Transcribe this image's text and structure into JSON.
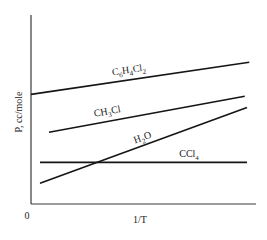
{
  "chart_data": {
    "type": "line",
    "title": "",
    "xlabel": "1/T",
    "ylabel": "P, cc/mole",
    "x_origin_label": "0",
    "xlim": [
      0,
      1
    ],
    "ylim": [
      0,
      1
    ],
    "grid": false,
    "legend": "inline labels",
    "note": "Schematic plot without numeric ticks; values are normalized to the axis extents (0 = origin, 1 = end of axis).",
    "series": [
      {
        "name": "C6H4Cl2",
        "label_parts": [
          [
            "C",
            ""
          ],
          [
            "6",
            "sub"
          ],
          [
            "H",
            ""
          ],
          [
            "4",
            "sub"
          ],
          [
            "Cl",
            ""
          ],
          [
            "2",
            "sub"
          ]
        ],
        "x": [
          0.0,
          0.97
        ],
        "y": [
          0.58,
          0.75
        ]
      },
      {
        "name": "CH3Cl",
        "label_parts": [
          [
            "CH",
            ""
          ],
          [
            "3",
            "sub"
          ],
          [
            "Cl",
            ""
          ]
        ],
        "x": [
          0.08,
          0.95
        ],
        "y": [
          0.38,
          0.57
        ]
      },
      {
        "name": "H2O",
        "label_parts": [
          [
            "H",
            ""
          ],
          [
            "2",
            "sub"
          ],
          [
            "O",
            ""
          ]
        ],
        "x": [
          0.04,
          0.96
        ],
        "y": [
          0.11,
          0.51
        ]
      },
      {
        "name": "CCl4",
        "label_parts": [
          [
            "CCl",
            ""
          ],
          [
            "4",
            "sub"
          ]
        ],
        "x": [
          0.04,
          0.96
        ],
        "y": [
          0.22,
          0.22
        ]
      }
    ]
  }
}
